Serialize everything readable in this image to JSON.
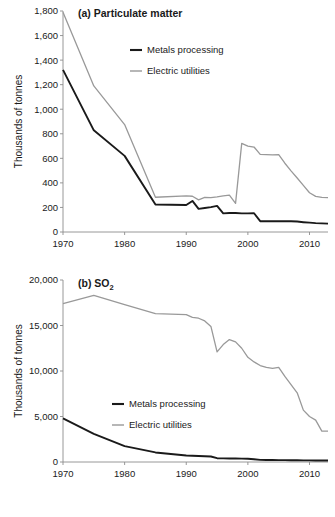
{
  "figure": {
    "name": "two-panel-emissions-line-chart",
    "panels": [
      "a",
      "b"
    ]
  },
  "colors": {
    "metals_processing": "#1a1a1a",
    "electric_utilities": "#999999",
    "axis": "#8c8c8c",
    "text": "#1a1a1a",
    "background": "#ffffff"
  },
  "legend": {
    "metals_label": "Metals processing",
    "electric_label": "Electric utilities"
  },
  "panel_a": {
    "title_prefix": "(a)",
    "title": "(a) Particulate matter",
    "ylabel": "Thousands of tonnes",
    "ytick_labels": [
      "0",
      "200",
      "400",
      "600",
      "800",
      "1,000",
      "1,200",
      "1,400",
      "1,600",
      "1,800"
    ],
    "xtick_labels": [
      "1970",
      "1980",
      "1990",
      "2000",
      "2010"
    ]
  },
  "panel_b": {
    "title_prefix": "(b)",
    "title_main": "SO",
    "title_sub": "2",
    "title": "(b) SO2",
    "ylabel": "Thousands of tonnes",
    "ytick_labels": [
      "0",
      "5,000",
      "10,000",
      "15,000",
      "20,000"
    ],
    "xtick_labels": [
      "1970",
      "1980",
      "1990",
      "2000",
      "2010"
    ]
  },
  "chart_data": [
    {
      "type": "line",
      "panel": "a",
      "title": "(a) Particulate matter",
      "xlabel": "",
      "ylabel": "Thousands of tonnes",
      "xlim": [
        1970,
        2013
      ],
      "ylim": [
        0,
        1800
      ],
      "ytick_step": 200,
      "xtick_step": 10,
      "grid": false,
      "legend_position": "upper-center",
      "x": [
        1970,
        1975,
        1980,
        1985,
        1990,
        1991,
        1992,
        1993,
        1994,
        1995,
        1996,
        1997,
        1998,
        1999,
        2000,
        2001,
        2002,
        2003,
        2004,
        2005,
        2006,
        2007,
        2008,
        2009,
        2010,
        2011,
        2012,
        2013
      ],
      "series": [
        {
          "name": "Metals processing",
          "color": "#1a1a1a",
          "values": [
            1320,
            828,
            620,
            224,
            220,
            253,
            188,
            196,
            203,
            213,
            152,
            155,
            155,
            152,
            152,
            153,
            88,
            88,
            88,
            88,
            88,
            87,
            85,
            80,
            76,
            72,
            70,
            68
          ]
        },
        {
          "name": "Electric utilities",
          "color": "#999999",
          "values": [
            1790,
            1190,
            875,
            283,
            295,
            291,
            262,
            282,
            280,
            286,
            294,
            300,
            233,
            722,
            700,
            692,
            632,
            630,
            628,
            630,
            560,
            498,
            440,
            380,
            320,
            290,
            282,
            280
          ]
        }
      ]
    },
    {
      "type": "line",
      "panel": "b",
      "title": "(b) SO2",
      "xlabel": "",
      "ylabel": "Thousands of tonnes",
      "xlim": [
        1970,
        2013
      ],
      "ylim": [
        0,
        20000
      ],
      "ytick_step": 5000,
      "xtick_step": 10,
      "grid": false,
      "legend_position": "center-left",
      "x": [
        1970,
        1975,
        1980,
        1985,
        1990,
        1991,
        1992,
        1993,
        1994,
        1995,
        1996,
        1997,
        1998,
        1999,
        2000,
        2001,
        2002,
        2003,
        2004,
        2005,
        2006,
        2007,
        2008,
        2009,
        2010,
        2011,
        2012,
        2013
      ],
      "series": [
        {
          "name": "Metals processing",
          "color": "#1a1a1a",
          "values": [
            4800,
            3100,
            1750,
            1050,
            720,
            690,
            660,
            640,
            600,
            420,
            400,
            390,
            380,
            370,
            360,
            300,
            230,
            220,
            215,
            210,
            205,
            200,
            195,
            180,
            175,
            170,
            165,
            160
          ]
        },
        {
          "name": "Electric utilities",
          "color": "#999999",
          "values": [
            17400,
            18300,
            17300,
            16300,
            16200,
            15900,
            15800,
            15500,
            14900,
            12100,
            12900,
            13450,
            13200,
            12500,
            11500,
            11000,
            10600,
            10400,
            10300,
            10400,
            9400,
            8500,
            7600,
            5700,
            5000,
            4600,
            3400,
            3400
          ]
        }
      ]
    }
  ]
}
